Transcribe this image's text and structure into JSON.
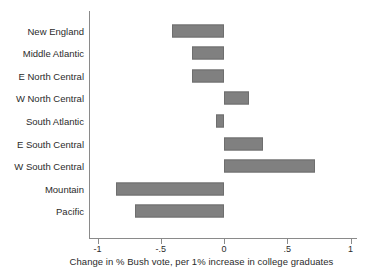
{
  "chart_data": {
    "type": "bar",
    "orientation": "horizontal",
    "title": "",
    "subtitle": "",
    "xlabel": "Change in % Bush vote, per 1% increase in college graduates",
    "ylabel": "",
    "xlim": [
      -1,
      1
    ],
    "xticks": [
      -1,
      -0.5,
      0,
      0.5,
      1
    ],
    "xtick_labels": [
      "-1",
      "-.5",
      "0",
      ".5",
      "1"
    ],
    "grid": false,
    "legend": null,
    "zero_line": 0,
    "bar_color": "#808080",
    "bar_edge_color": "#6e6e6e",
    "axis_color": "#8a8a8a",
    "text_color": "#2b2b2b",
    "categories": [
      "New England",
      "Middle Atlantic",
      "E North Central",
      "W North Central",
      "South Atlantic",
      "E South Central",
      "W South Central",
      "Mountain",
      "Pacific"
    ],
    "values": [
      -0.41,
      -0.25,
      -0.25,
      0.2,
      -0.06,
      0.31,
      0.72,
      -0.85,
      -0.7
    ],
    "series": [
      {
        "name": "Change in % Bush vote, per 1% increase in college graduates",
        "values": [
          -0.41,
          -0.25,
          -0.25,
          0.2,
          -0.06,
          0.31,
          0.72,
          -0.85,
          -0.7
        ]
      }
    ]
  }
}
